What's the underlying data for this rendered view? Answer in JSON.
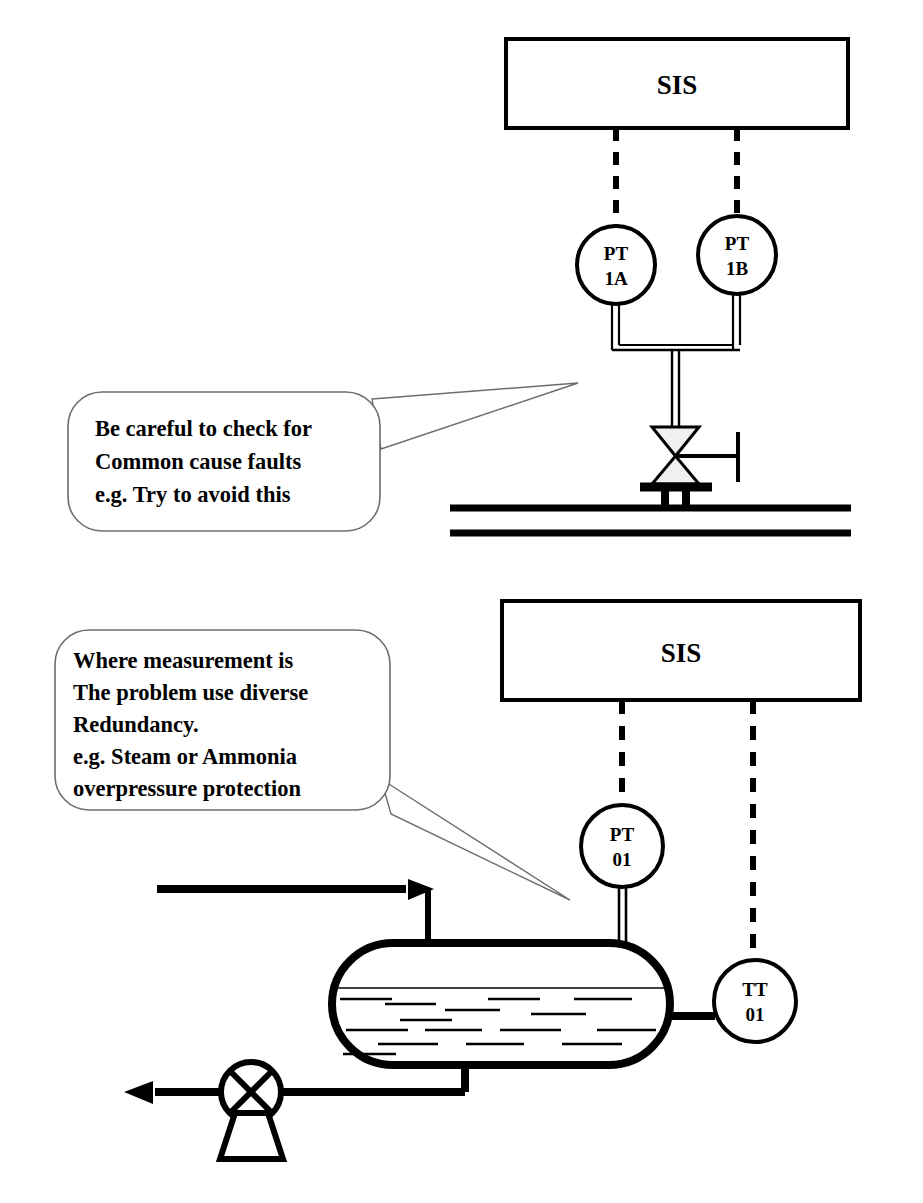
{
  "document": {
    "kind": "process-safety-instrumentation-diagram",
    "background_color": "#ffffff",
    "line_color": "#000000"
  },
  "sections": [
    {
      "id": "top",
      "name": "common-cause-fault-example",
      "logic_solver": {
        "label": "SIS"
      },
      "transmitters": [
        {
          "id": "pt-1a",
          "line1": "PT",
          "line2": "1A"
        },
        {
          "id": "pt-1b",
          "line1": "PT",
          "line2": "1B"
        }
      ],
      "callout": {
        "id": "callout-common-cause",
        "lines": [
          "Be careful to check for",
          "Common cause faults",
          "e.g. Try to avoid this"
        ]
      },
      "equipment": [
        {
          "id": "isolation-valve",
          "type": "manual-valve"
        },
        {
          "id": "process-pipe",
          "type": "pipe-run"
        }
      ]
    },
    {
      "id": "bottom",
      "name": "diverse-redundancy-example",
      "logic_solver": {
        "label": "SIS"
      },
      "transmitters": [
        {
          "id": "pt-01",
          "line1": "PT",
          "line2": "01"
        },
        {
          "id": "tt-01",
          "line1": "TT",
          "line2": "01"
        }
      ],
      "callout": {
        "id": "callout-diverse-redundancy",
        "lines": [
          "Where measurement is",
          "The problem use diverse",
          "Redundancy.",
          "e.g. Steam or Ammonia",
          "overpressure protection"
        ]
      },
      "equipment": [
        {
          "id": "vessel",
          "type": "horizontal-drum"
        },
        {
          "id": "inlet-line",
          "type": "arrow-line"
        },
        {
          "id": "dip-tube",
          "type": "internal-pipe"
        },
        {
          "id": "pump",
          "type": "centrifugal-pump"
        },
        {
          "id": "outlet-line",
          "type": "arrow-line"
        }
      ]
    }
  ]
}
